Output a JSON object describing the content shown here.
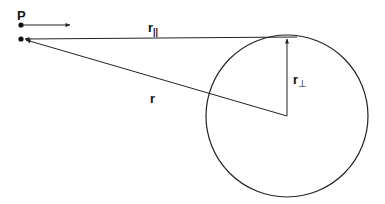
{
  "diagram": {
    "labels": {
      "point": "P",
      "r_parallel_main": "r",
      "r_parallel_sub": "||",
      "r": "r",
      "r_perp_main": "r",
      "r_perp_sub": "⊥"
    },
    "colors": {
      "stroke": "#222222",
      "background": "#ffffff"
    },
    "elements": [
      "point P with velocity arrow",
      "second point (observer position)",
      "vector r∥ from tangent point to observer",
      "vector r from circle center to observer",
      "vector r⊥ from circle center to tangent point",
      "circle"
    ]
  }
}
